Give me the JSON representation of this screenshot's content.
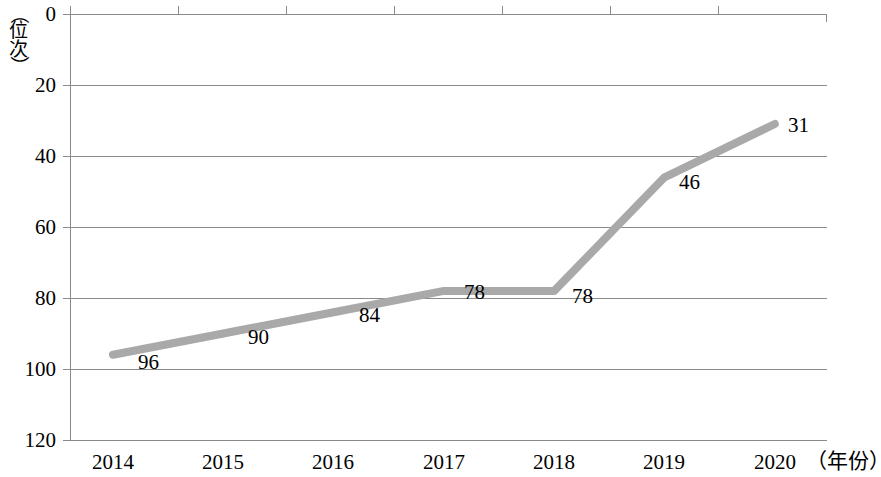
{
  "chart_data": {
    "type": "line",
    "title": "",
    "subtitle": "",
    "xlabel": "（年份）",
    "ylabel": "（位次）",
    "categories": [
      "2014",
      "2015",
      "2016",
      "2017",
      "2018",
      "2019",
      "2020"
    ],
    "values": [
      96,
      90,
      84,
      78,
      78,
      46,
      31
    ],
    "point_labels": [
      "96",
      "90",
      "84",
      "78",
      "78",
      "46",
      "31"
    ],
    "series": [
      {
        "name": "位次",
        "values": [
          96,
          90,
          84,
          78,
          78,
          46,
          31
        ]
      }
    ],
    "ylim": [
      0,
      120
    ],
    "y_inverted": true,
    "yticks": [
      "0",
      "20",
      "40",
      "60",
      "80",
      "100",
      "120"
    ],
    "ytick_values": [
      0,
      20,
      40,
      60,
      80,
      100,
      120
    ],
    "grid": "horizontal",
    "legend": "none",
    "line_color": "#a9a9a9",
    "axis_color": "#808080",
    "text_color": "#000000",
    "background": "#ffffff"
  },
  "axis": {
    "y_title_chars": [
      "（",
      "位",
      "次",
      "）"
    ],
    "x_title": "（年份）"
  }
}
